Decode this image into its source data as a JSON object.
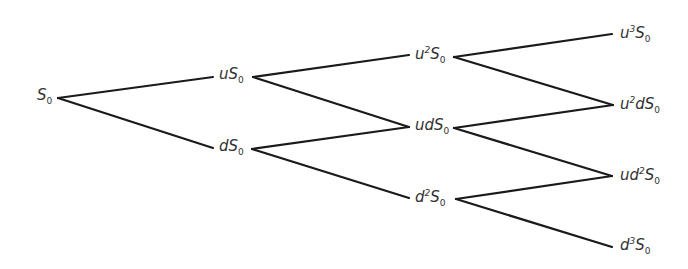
{
  "diagram": {
    "type": "binomial-tree",
    "steps": 3,
    "line_color": "#1a1a1a",
    "nodes": [
      {
        "id": "S0",
        "label": "S",
        "sub": "0",
        "prefix": "",
        "prefix_sup": "",
        "mid": "",
        "mid_sup": "",
        "x": 37,
        "y": 98
      },
      {
        "id": "uS0",
        "label": "S",
        "sub": "0",
        "prefix": "u",
        "prefix_sup": "",
        "mid": "",
        "mid_sup": "",
        "x": 219,
        "y": 77
      },
      {
        "id": "dS0",
        "label": "S",
        "sub": "0",
        "prefix": "d",
        "prefix_sup": "",
        "mid": "",
        "mid_sup": "",
        "x": 219,
        "y": 149
      },
      {
        "id": "u2S0",
        "label": "S",
        "sub": "0",
        "prefix": "u",
        "prefix_sup": "2",
        "mid": "",
        "mid_sup": "",
        "x": 415,
        "y": 56
      },
      {
        "id": "udS0",
        "label": "S",
        "sub": "0",
        "prefix": "ud",
        "prefix_sup": "",
        "mid": "",
        "mid_sup": "",
        "x": 415,
        "y": 128
      },
      {
        "id": "d2S0",
        "label": "S",
        "sub": "0",
        "prefix": "d",
        "prefix_sup": "2",
        "mid": "",
        "mid_sup": "",
        "x": 415,
        "y": 199
      },
      {
        "id": "u3S0",
        "label": "S",
        "sub": "0",
        "prefix": "u",
        "prefix_sup": "3",
        "mid": "",
        "mid_sup": "",
        "x": 620,
        "y": 35
      },
      {
        "id": "u2dS0",
        "label": "S",
        "sub": "0",
        "prefix": "u",
        "prefix_sup": "2",
        "mid": "d",
        "mid_sup": "",
        "x": 620,
        "y": 106
      },
      {
        "id": "ud2S0",
        "label": "S",
        "sub": "0",
        "prefix": "ud",
        "prefix_sup": "2",
        "mid": "",
        "mid_sup": "",
        "x": 620,
        "y": 177
      },
      {
        "id": "d3S0",
        "label": "S",
        "sub": "0",
        "prefix": "d",
        "prefix_sup": "3",
        "mid": "",
        "mid_sup": "",
        "x": 620,
        "y": 247
      }
    ],
    "edges": [
      {
        "from": "S0",
        "to": "uS0",
        "x1": 58,
        "y1": 98,
        "x2": 213,
        "y2": 77
      },
      {
        "from": "S0",
        "to": "dS0",
        "x1": 58,
        "y1": 98,
        "x2": 213,
        "y2": 148
      },
      {
        "from": "uS0",
        "to": "u2S0",
        "x1": 253,
        "y1": 77,
        "x2": 409,
        "y2": 55
      },
      {
        "from": "uS0",
        "to": "udS0",
        "x1": 253,
        "y1": 77,
        "x2": 409,
        "y2": 127
      },
      {
        "from": "dS0",
        "to": "udS0",
        "x1": 252,
        "y1": 149,
        "x2": 409,
        "y2": 127
      },
      {
        "from": "dS0",
        "to": "d2S0",
        "x1": 252,
        "y1": 149,
        "x2": 409,
        "y2": 198
      },
      {
        "from": "u2S0",
        "to": "u3S0",
        "x1": 454,
        "y1": 57,
        "x2": 612,
        "y2": 34
      },
      {
        "from": "u2S0",
        "to": "u2dS0",
        "x1": 454,
        "y1": 57,
        "x2": 613,
        "y2": 105
      },
      {
        "from": "udS0",
        "to": "u2dS0",
        "x1": 454,
        "y1": 128,
        "x2": 613,
        "y2": 105
      },
      {
        "from": "udS0",
        "to": "ud2S0",
        "x1": 454,
        "y1": 128,
        "x2": 612,
        "y2": 176
      },
      {
        "from": "d2S0",
        "to": "ud2S0",
        "x1": 456,
        "y1": 199,
        "x2": 612,
        "y2": 176
      },
      {
        "from": "d2S0",
        "to": "d3S0",
        "x1": 456,
        "y1": 199,
        "x2": 612,
        "y2": 247
      }
    ]
  }
}
